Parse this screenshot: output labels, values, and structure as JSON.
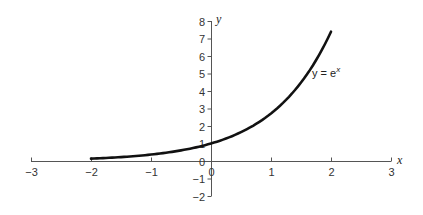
{
  "chart_data": {
    "type": "line",
    "title": "",
    "xlabel": "x",
    "ylabel": "y",
    "xlim": [
      -3,
      3
    ],
    "ylim": [
      -2,
      8
    ],
    "grid": false,
    "x_ticks": [
      -3,
      -2,
      -1,
      0,
      1,
      2,
      3
    ],
    "y_ticks": [
      -2,
      -1,
      0,
      1,
      2,
      3,
      4,
      5,
      6,
      7,
      8
    ],
    "x_tick_labels": [
      "−3",
      "−2",
      "−1",
      "0",
      "1",
      "2",
      "3"
    ],
    "y_tick_labels": [
      "−2",
      "−1",
      "0",
      "1",
      "2",
      "3",
      "4",
      "5",
      "6",
      "7",
      "8"
    ],
    "series": [
      {
        "name": "y = e^x",
        "label_text": "y = e",
        "label_superscript": "x",
        "function": "exp",
        "x": [
          -2,
          -1.5,
          -1,
          -0.5,
          0,
          0.5,
          1,
          1.5,
          2
        ],
        "values": [
          0.14,
          0.22,
          0.37,
          0.61,
          1.0,
          1.65,
          2.72,
          4.48,
          7.39
        ],
        "color": "#111111"
      }
    ],
    "annotations": [
      {
        "text": "y = e^x",
        "x": 1.7,
        "y": 5
      }
    ],
    "colors": {
      "axis": "#555555",
      "curve": "#111111",
      "text": "#333333"
    }
  }
}
